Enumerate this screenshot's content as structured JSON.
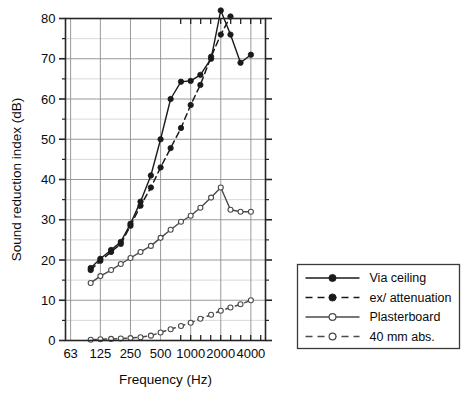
{
  "chart_data": {
    "type": "line",
    "title": "",
    "xlabel": "Frequency (Hz)",
    "ylabel": "Sound reduction index (dB)",
    "xscale": "log",
    "xlim": [
      56,
      5600
    ],
    "ylim": [
      0,
      80
    ],
    "ytick_step": 10,
    "ytick_minor_step": 5,
    "grid": true,
    "grid_x_major": [
      63,
      125,
      250,
      500,
      1000,
      2000,
      4000
    ],
    "xtick_labels": [
      "63",
      "125",
      "250",
      "500",
      "1000",
      "2000",
      "4000"
    ],
    "xtick_values": [
      63,
      125,
      250,
      500,
      1000,
      2000,
      4000
    ],
    "ytick_labels": [
      "0",
      "10",
      "20",
      "30",
      "40",
      "50",
      "60",
      "70",
      "80"
    ],
    "ytick_values": [
      0,
      10,
      20,
      30,
      40,
      50,
      60,
      70,
      80
    ],
    "x_bands": [
      100,
      125,
      160,
      200,
      250,
      315,
      400,
      500,
      630,
      800,
      1000,
      1250,
      1600,
      2000,
      2500,
      3150,
      4000
    ],
    "legend_position": "outside-right-bottom",
    "series": [
      {
        "name": "Via ceiling",
        "marker": "filled-circle",
        "linestyle": "solid",
        "color": "#1a1a1a",
        "x": [
          100,
          125,
          160,
          200,
          250,
          315,
          400,
          500,
          630,
          800,
          1000,
          1250,
          1600,
          2000,
          2500,
          3150,
          4000
        ],
        "values": [
          18.0,
          20.3,
          22.5,
          24.5,
          29.0,
          34.5,
          41.0,
          50.0,
          60.0,
          64.3,
          64.5,
          66.0,
          70.0,
          82.0,
          76.0,
          69.0,
          71.0
        ]
      },
      {
        "name": "ex/ attenuation",
        "marker": "filled-circle",
        "linestyle": "dashed",
        "color": "#1a1a1a",
        "x": [
          100,
          125,
          160,
          200,
          250,
          315,
          400,
          500,
          630,
          800,
          1000,
          1250,
          1600,
          2000,
          2500
        ],
        "values": [
          17.5,
          19.8,
          22.0,
          24.0,
          28.5,
          33.5,
          38.0,
          43.0,
          47.8,
          52.8,
          58.5,
          63.5,
          70.5,
          76.0,
          80.5
        ]
      },
      {
        "name": "Plasterboard",
        "marker": "open-circle",
        "linestyle": "solid",
        "color": "#4a4a4a",
        "x": [
          100,
          125,
          160,
          200,
          250,
          315,
          400,
          500,
          630,
          800,
          1000,
          1250,
          1600,
          2000,
          2500,
          3150,
          4000
        ],
        "values": [
          14.3,
          16.0,
          17.5,
          19.0,
          20.5,
          22.0,
          23.5,
          25.5,
          27.5,
          29.5,
          31.0,
          33.0,
          35.5,
          38.0,
          32.5,
          32.0,
          32.0
        ]
      },
      {
        "name": "40 mm abs.",
        "marker": "open-circle",
        "linestyle": "dashed",
        "color": "#4a4a4a",
        "x": [
          100,
          125,
          160,
          200,
          250,
          315,
          400,
          500,
          630,
          800,
          1000,
          1250,
          1600,
          2000,
          2500,
          3150,
          4000
        ],
        "values": [
          0.2,
          0.3,
          0.4,
          0.5,
          0.6,
          0.8,
          1.2,
          2.0,
          2.8,
          3.6,
          4.4,
          5.4,
          6.4,
          7.4,
          8.2,
          9.0,
          10.0
        ]
      }
    ]
  },
  "legend": {
    "entries": [
      {
        "label": "Via ceiling",
        "marker": "filled-circle",
        "linestyle": "solid"
      },
      {
        "label": "ex/ attenuation",
        "marker": "filled-circle",
        "linestyle": "dashed"
      },
      {
        "label": "Plasterboard",
        "marker": "open-circle",
        "linestyle": "solid"
      },
      {
        "label": "40 mm abs.",
        "marker": "open-circle",
        "linestyle": "dashed"
      }
    ]
  }
}
